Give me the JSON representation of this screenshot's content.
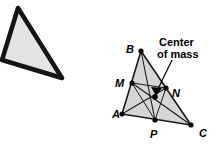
{
  "figure": {
    "title_absent": true,
    "background_color": "#ffffff",
    "stroke_color": "#000000",
    "fill_color": "#d9d9d9",
    "left_shape": {
      "name": "tilted-triangle",
      "fill": "#e0e0e0",
      "stroke": "#111111",
      "stroke_width": 4,
      "points": "18,8 62,78 2,60"
    },
    "right_shape": {
      "name": "triangle-abc-with-medians",
      "fill": "#d4d4d4",
      "stroke": "#1a1a1a",
      "vertices": [
        {
          "id": "A",
          "label": "A",
          "x": 122,
          "y": 114,
          "label_x": 112,
          "label_y": 117
        },
        {
          "id": "B",
          "label": "B",
          "x": 141,
          "y": 51,
          "label_x": 127,
          "label_y": 52
        },
        {
          "id": "C",
          "label": "C",
          "x": 191,
          "y": 125,
          "label_x": 199,
          "label_y": 135
        }
      ],
      "midpoints": [
        {
          "id": "M",
          "label": "M",
          "x": 132,
          "y": 83,
          "label_x": 118,
          "label_y": 85,
          "on_side": "AB"
        },
        {
          "id": "N",
          "label": "N",
          "x": 166,
          "y": 88,
          "label_x": 172,
          "label_y": 96,
          "on_side": "BC"
        },
        {
          "id": "P",
          "label": "P",
          "x": 155,
          "y": 120,
          "label_x": 150,
          "label_y": 136,
          "on_side": "AC"
        }
      ],
      "centroid": {
        "id": "G",
        "x": 155,
        "y": 97
      }
    },
    "callout": {
      "name": "center-of-mass-callout",
      "line1": "Center",
      "line2": "of mass",
      "line1_x": 160,
      "line1_y": 45,
      "line2_x": 158,
      "line2_y": 57,
      "leader_from_x": 172,
      "leader_from_y": 60,
      "leader_to_x": 156,
      "leader_to_y": 93
    }
  }
}
